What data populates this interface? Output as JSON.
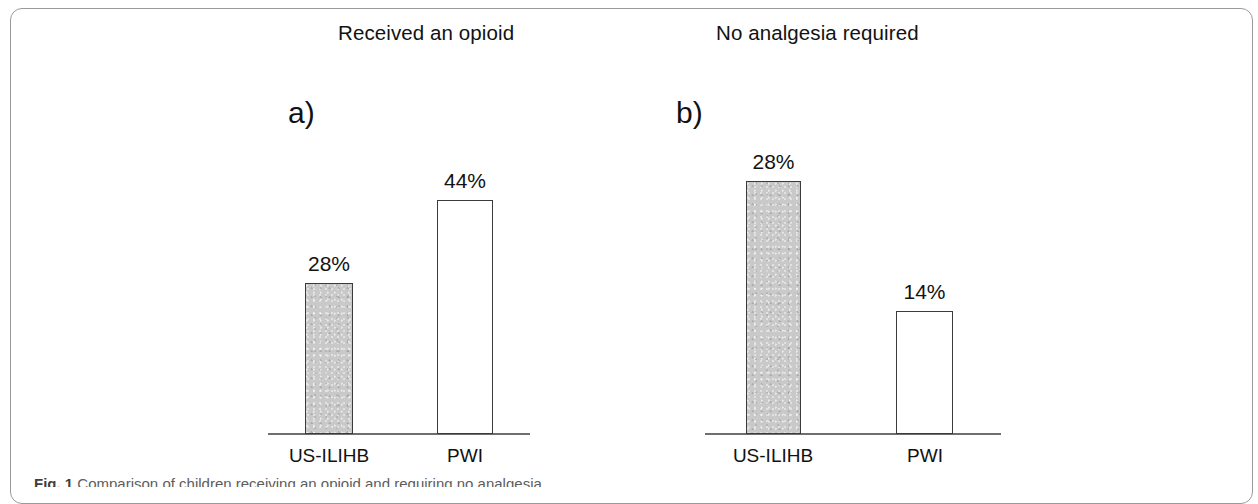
{
  "figure": {
    "caption_label": "Fig. 1",
    "caption_text": "Comparison of children receiving an opioid and requiring no analgesia"
  },
  "panels": [
    {
      "letter": "a)",
      "title": "Received an opioid",
      "categories": [
        "US-ILIHB",
        "PWI"
      ],
      "value_labels": [
        "28%",
        "44%"
      ]
    },
    {
      "letter": "b)",
      "title": "No analgesia required",
      "categories": [
        "US-ILIHB",
        "PWI"
      ],
      "value_labels": [
        "28%",
        "14%"
      ]
    }
  ],
  "chart_data": [
    {
      "type": "bar",
      "title": "Received an opioid",
      "panel_letter": "a)",
      "categories": [
        "US-ILIHB",
        "PWI"
      ],
      "values": [
        28,
        44
      ],
      "data_labels": [
        "28%",
        "44%"
      ],
      "units": "percent",
      "xlabel": "",
      "ylabel": "",
      "ylim": [
        0,
        55
      ],
      "grid": false,
      "legend": null,
      "bar_styles": [
        {
          "category": "US-ILIHB",
          "fill": "#c9c9c9",
          "edge": "#3b3b3b"
        },
        {
          "category": "PWI",
          "fill": "#ffffff",
          "edge": "#3b3b3b"
        }
      ]
    },
    {
      "type": "bar",
      "title": "No analgesia required",
      "panel_letter": "b)",
      "categories": [
        "US-ILIHB",
        "PWI"
      ],
      "values": [
        28,
        14
      ],
      "data_labels": [
        "28%",
        "14%"
      ],
      "units": "percent",
      "xlabel": "",
      "ylabel": "",
      "ylim": [
        0,
        31
      ],
      "grid": false,
      "legend": null,
      "bar_styles": [
        {
          "category": "US-ILIHB",
          "fill": "#c9c9c9",
          "edge": "#3b3b3b"
        },
        {
          "category": "PWI",
          "fill": "#ffffff",
          "edge": "#3b3b3b"
        }
      ]
    }
  ],
  "colors": {
    "bar_fill_gray": "#c9c9c9",
    "bar_edge": "#3b3b3b",
    "axis_line": "#6f6f6f",
    "frame_border": "#9a9a9a",
    "text": "#121212",
    "background": "#ffffff"
  }
}
